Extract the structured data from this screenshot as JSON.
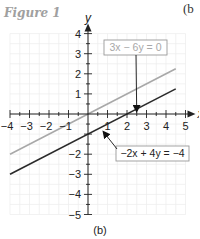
{
  "figure_label": "Figure 1",
  "corner_label": "(b",
  "caption": "(b)",
  "colors": {
    "grid": "#ececec",
    "axis": "#222222",
    "line_gray": "#a8a8a8",
    "line_dark": "#2a2a2a",
    "box_border": "#999999"
  },
  "chart_data": {
    "type": "line",
    "title": "",
    "xlabel": "x",
    "ylabel": "y",
    "xlim": [
      -4,
      5
    ],
    "ylim": [
      -5,
      4
    ],
    "grid": true,
    "x_ticks": [
      -4,
      -3,
      -2,
      -1,
      1,
      2,
      3,
      4,
      5
    ],
    "y_ticks": [
      -5,
      -4,
      -3,
      -2,
      1,
      2,
      3,
      4
    ],
    "x_tick_labels": [
      "−4",
      "−3",
      "−2",
      "−1",
      "1",
      "2",
      "3",
      "4",
      "5"
    ],
    "y_tick_labels": [
      "−5",
      "−4",
      "−3",
      "−2",
      "1",
      "2",
      "3",
      "4"
    ],
    "series": [
      {
        "name": "3x − 6y = 0",
        "label": "3x − 6y = 0",
        "color": "#a8a8a8",
        "x": [
          -4,
          4.5
        ],
        "y": [
          -2,
          2.25
        ]
      },
      {
        "name": "−2x + 4y = −4",
        "label": "−2x + 4y = −4",
        "color": "#2a2a2a",
        "x": [
          -4,
          4.5
        ],
        "y": [
          -3,
          1.25
        ]
      }
    ],
    "annotations": [
      {
        "text": "3x − 6y = 0",
        "points_to": [
          2.6,
          0.4
        ]
      },
      {
        "text": "−2x + 4y = −4",
        "points_to": [
          0.7,
          -0.7
        ]
      }
    ]
  }
}
